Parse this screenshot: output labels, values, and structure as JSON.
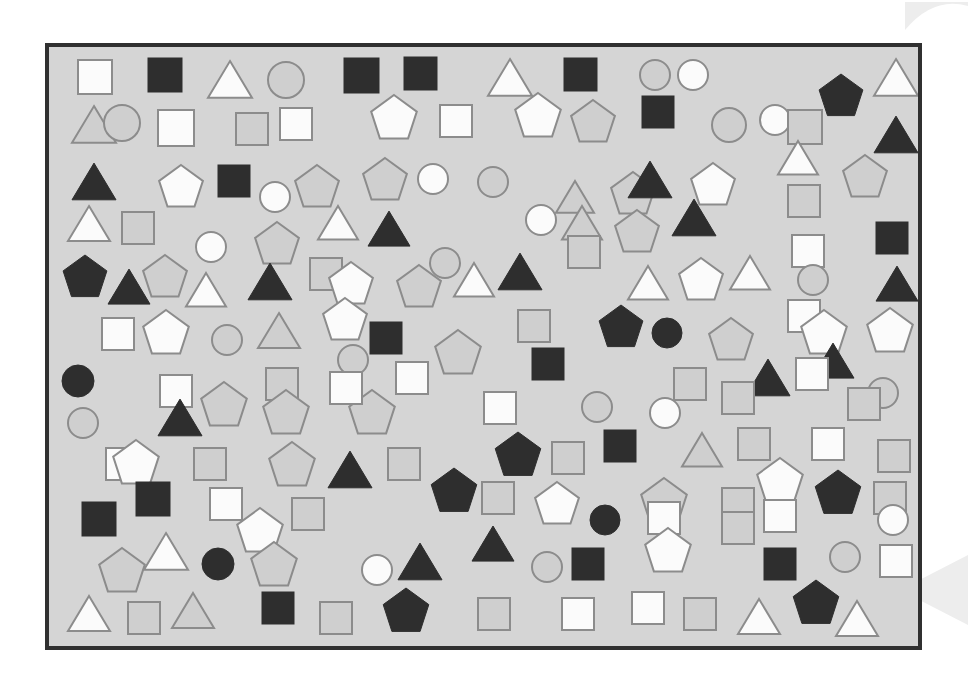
{
  "canvas": {
    "width": 968,
    "height": 697,
    "background_color": "#ffffff",
    "description": "Shape counting visual puzzle: scattered squares, circles, triangles and pentagons"
  },
  "frame": {
    "x": 47,
    "y": 45,
    "width": 873,
    "height": 603,
    "fill_color": "#d5d5d5",
    "border_color": "#303030",
    "border_width": 4
  },
  "palette": {
    "white_fill": "#fbfbfb",
    "dark_fill": "#2e2e2e",
    "gray_fill": "#cfcfcf",
    "outline_gray": "#8c8c8c",
    "outline_dark": "#2e2e2e",
    "panel_bg": "#d5d5d5",
    "watermark": "#ededed"
  },
  "legend": {
    "shape_types": [
      "square",
      "circle",
      "triangle",
      "pentagon"
    ],
    "fill_variants": [
      "white",
      "dark",
      "gray"
    ]
  },
  "counts": {
    "total_shapes": 203,
    "squares": 70,
    "circles": 32,
    "triangles": 41,
    "pentagons": 60,
    "white_shapes": 76,
    "dark_shapes": 47,
    "gray_shapes": 80
  },
  "watermarks": [
    {
      "name": "corner-arc",
      "x": 905,
      "y": 2,
      "w": 63,
      "h": 28,
      "type": "arc"
    },
    {
      "name": "right-chevron",
      "x": 900,
      "y": 555,
      "w": 68,
      "h": 70,
      "type": "chevron"
    }
  ],
  "shapes": [
    {
      "t": "square",
      "f": "white",
      "x": 78,
      "y": 60,
      "s": 34
    },
    {
      "t": "square",
      "f": "dark",
      "x": 148,
      "y": 58,
      "s": 34
    },
    {
      "t": "triangle",
      "f": "white",
      "x": 208,
      "y": 60,
      "s": 44
    },
    {
      "t": "circle",
      "f": "gray",
      "x": 268,
      "y": 62,
      "s": 36
    },
    {
      "t": "square",
      "f": "dark",
      "x": 344,
      "y": 58,
      "s": 35
    },
    {
      "t": "square",
      "f": "dark",
      "x": 404,
      "y": 57,
      "s": 33
    },
    {
      "t": "triangle",
      "f": "white",
      "x": 488,
      "y": 58,
      "s": 44
    },
    {
      "t": "square",
      "f": "dark",
      "x": 564,
      "y": 58,
      "s": 33
    },
    {
      "t": "circle",
      "f": "gray",
      "x": 640,
      "y": 60,
      "s": 30
    },
    {
      "t": "circle",
      "f": "white",
      "x": 678,
      "y": 60,
      "s": 30
    },
    {
      "t": "pentagon",
      "f": "dark",
      "x": 818,
      "y": 74,
      "s": 46
    },
    {
      "t": "triangle",
      "f": "white",
      "x": 874,
      "y": 58,
      "s": 44
    },
    {
      "t": "triangle",
      "f": "gray",
      "x": 72,
      "y": 105,
      "s": 44
    },
    {
      "t": "circle",
      "f": "gray",
      "x": 104,
      "y": 105,
      "s": 36
    },
    {
      "t": "square",
      "f": "white",
      "x": 158,
      "y": 110,
      "s": 36
    },
    {
      "t": "square",
      "f": "gray",
      "x": 236,
      "y": 113,
      "s": 32
    },
    {
      "t": "square",
      "f": "white",
      "x": 280,
      "y": 108,
      "s": 32
    },
    {
      "t": "pentagon",
      "f": "white",
      "x": 370,
      "y": 95,
      "s": 48
    },
    {
      "t": "square",
      "f": "white",
      "x": 440,
      "y": 105,
      "s": 32
    },
    {
      "t": "pentagon",
      "f": "white",
      "x": 514,
      "y": 93,
      "s": 48
    },
    {
      "t": "pentagon",
      "f": "gray",
      "x": 570,
      "y": 100,
      "s": 46
    },
    {
      "t": "square",
      "f": "dark",
      "x": 642,
      "y": 96,
      "s": 32
    },
    {
      "t": "circle",
      "f": "gray",
      "x": 712,
      "y": 108,
      "s": 34
    },
    {
      "t": "circle",
      "f": "white",
      "x": 760,
      "y": 105,
      "s": 30
    },
    {
      "t": "square",
      "f": "gray",
      "x": 788,
      "y": 110,
      "s": 34
    },
    {
      "t": "triangle",
      "f": "dark",
      "x": 874,
      "y": 115,
      "s": 44
    },
    {
      "t": "triangle",
      "f": "dark",
      "x": 72,
      "y": 162,
      "s": 44
    },
    {
      "t": "pentagon",
      "f": "white",
      "x": 158,
      "y": 165,
      "s": 46
    },
    {
      "t": "square",
      "f": "dark",
      "x": 218,
      "y": 165,
      "s": 32
    },
    {
      "t": "circle",
      "f": "white",
      "x": 260,
      "y": 182,
      "s": 30
    },
    {
      "t": "pentagon",
      "f": "gray",
      "x": 294,
      "y": 165,
      "s": 46
    },
    {
      "t": "pentagon",
      "f": "gray",
      "x": 362,
      "y": 158,
      "s": 46
    },
    {
      "t": "circle",
      "f": "white",
      "x": 418,
      "y": 164,
      "s": 30
    },
    {
      "t": "circle",
      "f": "gray",
      "x": 478,
      "y": 167,
      "s": 30
    },
    {
      "t": "triangle",
      "f": "gray",
      "x": 556,
      "y": 180,
      "s": 38
    },
    {
      "t": "pentagon",
      "f": "gray",
      "x": 610,
      "y": 172,
      "s": 46
    },
    {
      "t": "triangle",
      "f": "dark",
      "x": 628,
      "y": 160,
      "s": 44
    },
    {
      "t": "pentagon",
      "f": "white",
      "x": 690,
      "y": 163,
      "s": 46
    },
    {
      "t": "triangle",
      "f": "white",
      "x": 778,
      "y": 140,
      "s": 40
    },
    {
      "t": "pentagon",
      "f": "gray",
      "x": 842,
      "y": 155,
      "s": 46
    },
    {
      "t": "square",
      "f": "gray",
      "x": 788,
      "y": 185,
      "s": 32
    },
    {
      "t": "triangle",
      "f": "white",
      "x": 68,
      "y": 205,
      "s": 42
    },
    {
      "t": "square",
      "f": "gray",
      "x": 122,
      "y": 212,
      "s": 32
    },
    {
      "t": "circle",
      "f": "white",
      "x": 196,
      "y": 232,
      "s": 30
    },
    {
      "t": "pentagon",
      "f": "gray",
      "x": 254,
      "y": 222,
      "s": 46
    },
    {
      "t": "triangle",
      "f": "white",
      "x": 318,
      "y": 205,
      "s": 40
    },
    {
      "t": "triangle",
      "f": "dark",
      "x": 368,
      "y": 210,
      "s": 42
    },
    {
      "t": "circle",
      "f": "white",
      "x": 526,
      "y": 205,
      "s": 30
    },
    {
      "t": "triangle",
      "f": "gray",
      "x": 562,
      "y": 205,
      "s": 40
    },
    {
      "t": "pentagon",
      "f": "gray",
      "x": 614,
      "y": 210,
      "s": 46
    },
    {
      "t": "triangle",
      "f": "dark",
      "x": 672,
      "y": 198,
      "s": 44
    },
    {
      "t": "square",
      "f": "gray",
      "x": 568,
      "y": 236,
      "s": 32
    },
    {
      "t": "square",
      "f": "white",
      "x": 792,
      "y": 235,
      "s": 32
    },
    {
      "t": "square",
      "f": "dark",
      "x": 876,
      "y": 222,
      "s": 32
    },
    {
      "t": "pentagon",
      "f": "dark",
      "x": 62,
      "y": 255,
      "s": 46
    },
    {
      "t": "triangle",
      "f": "dark",
      "x": 108,
      "y": 268,
      "s": 42
    },
    {
      "t": "pentagon",
      "f": "gray",
      "x": 142,
      "y": 255,
      "s": 46
    },
    {
      "t": "triangle",
      "f": "white",
      "x": 186,
      "y": 272,
      "s": 40
    },
    {
      "t": "square",
      "f": "gray",
      "x": 310,
      "y": 258,
      "s": 32
    },
    {
      "t": "triangle",
      "f": "dark",
      "x": 248,
      "y": 262,
      "s": 44
    },
    {
      "t": "pentagon",
      "f": "white",
      "x": 328,
      "y": 262,
      "s": 46
    },
    {
      "t": "pentagon",
      "f": "gray",
      "x": 396,
      "y": 265,
      "s": 46
    },
    {
      "t": "circle",
      "f": "gray",
      "x": 430,
      "y": 248,
      "s": 30
    },
    {
      "t": "triangle",
      "f": "white",
      "x": 454,
      "y": 262,
      "s": 40
    },
    {
      "t": "triangle",
      "f": "dark",
      "x": 498,
      "y": 252,
      "s": 44
    },
    {
      "t": "triangle",
      "f": "white",
      "x": 628,
      "y": 265,
      "s": 40
    },
    {
      "t": "pentagon",
      "f": "white",
      "x": 678,
      "y": 258,
      "s": 46
    },
    {
      "t": "triangle",
      "f": "white",
      "x": 730,
      "y": 255,
      "s": 40
    },
    {
      "t": "circle",
      "f": "gray",
      "x": 798,
      "y": 265,
      "s": 30
    },
    {
      "t": "triangle",
      "f": "dark",
      "x": 876,
      "y": 265,
      "s": 42
    },
    {
      "t": "square",
      "f": "white",
      "x": 102,
      "y": 318,
      "s": 32
    },
    {
      "t": "pentagon",
      "f": "white",
      "x": 142,
      "y": 310,
      "s": 48
    },
    {
      "t": "circle",
      "f": "gray",
      "x": 212,
      "y": 325,
      "s": 30
    },
    {
      "t": "triangle",
      "f": "gray",
      "x": 258,
      "y": 312,
      "s": 42
    },
    {
      "t": "pentagon",
      "f": "white",
      "x": 322,
      "y": 298,
      "s": 46
    },
    {
      "t": "square",
      "f": "dark",
      "x": 370,
      "y": 322,
      "s": 32
    },
    {
      "t": "pentagon",
      "f": "gray",
      "x": 434,
      "y": 330,
      "s": 48
    },
    {
      "t": "square",
      "f": "gray",
      "x": 518,
      "y": 310,
      "s": 32
    },
    {
      "t": "pentagon",
      "f": "dark",
      "x": 598,
      "y": 305,
      "s": 46
    },
    {
      "t": "circle",
      "f": "dark",
      "x": 652,
      "y": 318,
      "s": 30
    },
    {
      "t": "pentagon",
      "f": "gray",
      "x": 708,
      "y": 318,
      "s": 46
    },
    {
      "t": "square",
      "f": "white",
      "x": 788,
      "y": 300,
      "s": 32
    },
    {
      "t": "pentagon",
      "f": "white",
      "x": 800,
      "y": 310,
      "s": 48
    },
    {
      "t": "pentagon",
      "f": "white",
      "x": 866,
      "y": 308,
      "s": 48
    },
    {
      "t": "circle",
      "f": "gray",
      "x": 338,
      "y": 345,
      "s": 30
    },
    {
      "t": "square",
      "f": "dark",
      "x": 532,
      "y": 348,
      "s": 32
    },
    {
      "t": "circle",
      "f": "dark",
      "x": 62,
      "y": 365,
      "s": 32
    },
    {
      "t": "square",
      "f": "white",
      "x": 160,
      "y": 375,
      "s": 32
    },
    {
      "t": "square",
      "f": "gray",
      "x": 266,
      "y": 368,
      "s": 32
    },
    {
      "t": "square",
      "f": "white",
      "x": 396,
      "y": 362,
      "s": 32
    },
    {
      "t": "triangle",
      "f": "dark",
      "x": 746,
      "y": 358,
      "s": 44
    },
    {
      "t": "triangle",
      "f": "dark",
      "x": 812,
      "y": 342,
      "s": 42
    },
    {
      "t": "circle",
      "f": "gray",
      "x": 868,
      "y": 378,
      "s": 30
    },
    {
      "t": "circle",
      "f": "gray",
      "x": 68,
      "y": 408,
      "s": 30
    },
    {
      "t": "triangle",
      "f": "dark",
      "x": 158,
      "y": 398,
      "s": 44
    },
    {
      "t": "pentagon",
      "f": "gray",
      "x": 200,
      "y": 382,
      "s": 48
    },
    {
      "t": "pentagon",
      "f": "gray",
      "x": 262,
      "y": 390,
      "s": 48
    },
    {
      "t": "pentagon",
      "f": "gray",
      "x": 348,
      "y": 390,
      "s": 48
    },
    {
      "t": "square",
      "f": "white",
      "x": 330,
      "y": 372,
      "s": 32
    },
    {
      "t": "square",
      "f": "white",
      "x": 484,
      "y": 392,
      "s": 32
    },
    {
      "t": "circle",
      "f": "gray",
      "x": 582,
      "y": 392,
      "s": 30
    },
    {
      "t": "circle",
      "f": "white",
      "x": 650,
      "y": 398,
      "s": 30
    },
    {
      "t": "square",
      "f": "gray",
      "x": 674,
      "y": 368,
      "s": 32
    },
    {
      "t": "square",
      "f": "gray",
      "x": 722,
      "y": 382,
      "s": 32
    },
    {
      "t": "square",
      "f": "white",
      "x": 796,
      "y": 358,
      "s": 32
    },
    {
      "t": "square",
      "f": "gray",
      "x": 848,
      "y": 388,
      "s": 32
    },
    {
      "t": "square",
      "f": "white",
      "x": 106,
      "y": 448,
      "s": 32
    },
    {
      "t": "pentagon",
      "f": "white",
      "x": 112,
      "y": 440,
      "s": 48
    },
    {
      "t": "square",
      "f": "gray",
      "x": 194,
      "y": 448,
      "s": 32
    },
    {
      "t": "pentagon",
      "f": "gray",
      "x": 268,
      "y": 442,
      "s": 48
    },
    {
      "t": "triangle",
      "f": "dark",
      "x": 328,
      "y": 450,
      "s": 44
    },
    {
      "t": "square",
      "f": "gray",
      "x": 388,
      "y": 448,
      "s": 32
    },
    {
      "t": "pentagon",
      "f": "dark",
      "x": 494,
      "y": 432,
      "s": 48
    },
    {
      "t": "square",
      "f": "gray",
      "x": 552,
      "y": 442,
      "s": 32
    },
    {
      "t": "square",
      "f": "dark",
      "x": 604,
      "y": 430,
      "s": 32
    },
    {
      "t": "triangle",
      "f": "gray",
      "x": 682,
      "y": 432,
      "s": 40
    },
    {
      "t": "square",
      "f": "gray",
      "x": 738,
      "y": 428,
      "s": 32
    },
    {
      "t": "square",
      "f": "white",
      "x": 812,
      "y": 428,
      "s": 32
    },
    {
      "t": "square",
      "f": "gray",
      "x": 878,
      "y": 440,
      "s": 32
    },
    {
      "t": "square",
      "f": "dark",
      "x": 136,
      "y": 482,
      "s": 34
    },
    {
      "t": "square",
      "f": "white",
      "x": 210,
      "y": 488,
      "s": 32
    },
    {
      "t": "pentagon",
      "f": "dark",
      "x": 430,
      "y": 468,
      "s": 48
    },
    {
      "t": "square",
      "f": "gray",
      "x": 482,
      "y": 482,
      "s": 32
    },
    {
      "t": "pentagon",
      "f": "white",
      "x": 534,
      "y": 482,
      "s": 46
    },
    {
      "t": "pentagon",
      "f": "gray",
      "x": 640,
      "y": 478,
      "s": 48
    },
    {
      "t": "square",
      "f": "gray",
      "x": 722,
      "y": 488,
      "s": 32
    },
    {
      "t": "pentagon",
      "f": "white",
      "x": 756,
      "y": 458,
      "s": 48
    },
    {
      "t": "pentagon",
      "f": "dark",
      "x": 814,
      "y": 470,
      "s": 48
    },
    {
      "t": "square",
      "f": "gray",
      "x": 874,
      "y": 482,
      "s": 32
    },
    {
      "t": "square",
      "f": "dark",
      "x": 82,
      "y": 502,
      "s": 34
    },
    {
      "t": "square",
      "f": "gray",
      "x": 292,
      "y": 498,
      "s": 32
    },
    {
      "t": "pentagon",
      "f": "white",
      "x": 236,
      "y": 508,
      "s": 48
    },
    {
      "t": "circle",
      "f": "dark",
      "x": 590,
      "y": 505,
      "s": 30
    },
    {
      "t": "square",
      "f": "white",
      "x": 648,
      "y": 502,
      "s": 32
    },
    {
      "t": "square",
      "f": "white",
      "x": 764,
      "y": 500,
      "s": 32
    },
    {
      "t": "square",
      "f": "gray",
      "x": 722,
      "y": 512,
      "s": 32
    },
    {
      "t": "circle",
      "f": "white",
      "x": 878,
      "y": 505,
      "s": 30
    },
    {
      "t": "pentagon",
      "f": "gray",
      "x": 98,
      "y": 548,
      "s": 48
    },
    {
      "t": "triangle",
      "f": "white",
      "x": 144,
      "y": 532,
      "s": 44
    },
    {
      "t": "circle",
      "f": "dark",
      "x": 202,
      "y": 548,
      "s": 32
    },
    {
      "t": "pentagon",
      "f": "gray",
      "x": 250,
      "y": 542,
      "s": 48
    },
    {
      "t": "circle",
      "f": "white",
      "x": 362,
      "y": 555,
      "s": 30
    },
    {
      "t": "triangle",
      "f": "dark",
      "x": 398,
      "y": 542,
      "s": 44
    },
    {
      "t": "triangle",
      "f": "dark",
      "x": 472,
      "y": 525,
      "s": 42
    },
    {
      "t": "circle",
      "f": "gray",
      "x": 532,
      "y": 552,
      "s": 30
    },
    {
      "t": "square",
      "f": "dark",
      "x": 572,
      "y": 548,
      "s": 32
    },
    {
      "t": "pentagon",
      "f": "white",
      "x": 644,
      "y": 528,
      "s": 48
    },
    {
      "t": "square",
      "f": "dark",
      "x": 764,
      "y": 548,
      "s": 32
    },
    {
      "t": "circle",
      "f": "gray",
      "x": 830,
      "y": 542,
      "s": 30
    },
    {
      "t": "square",
      "f": "white",
      "x": 880,
      "y": 545,
      "s": 32
    },
    {
      "t": "triangle",
      "f": "white",
      "x": 68,
      "y": 595,
      "s": 42
    },
    {
      "t": "square",
      "f": "gray",
      "x": 128,
      "y": 602,
      "s": 32
    },
    {
      "t": "triangle",
      "f": "gray",
      "x": 172,
      "y": 592,
      "s": 42
    },
    {
      "t": "square",
      "f": "dark",
      "x": 262,
      "y": 592,
      "s": 32
    },
    {
      "t": "square",
      "f": "gray",
      "x": 320,
      "y": 602,
      "s": 32
    },
    {
      "t": "pentagon",
      "f": "dark",
      "x": 382,
      "y": 588,
      "s": 48
    },
    {
      "t": "square",
      "f": "gray",
      "x": 478,
      "y": 598,
      "s": 32
    },
    {
      "t": "square",
      "f": "white",
      "x": 562,
      "y": 598,
      "s": 32
    },
    {
      "t": "square",
      "f": "white",
      "x": 632,
      "y": 592,
      "s": 32
    },
    {
      "t": "square",
      "f": "gray",
      "x": 684,
      "y": 598,
      "s": 32
    },
    {
      "t": "triangle",
      "f": "white",
      "x": 738,
      "y": 598,
      "s": 42
    },
    {
      "t": "pentagon",
      "f": "dark",
      "x": 792,
      "y": 580,
      "s": 48
    },
    {
      "t": "triangle",
      "f": "white",
      "x": 836,
      "y": 600,
      "s": 42
    }
  ]
}
